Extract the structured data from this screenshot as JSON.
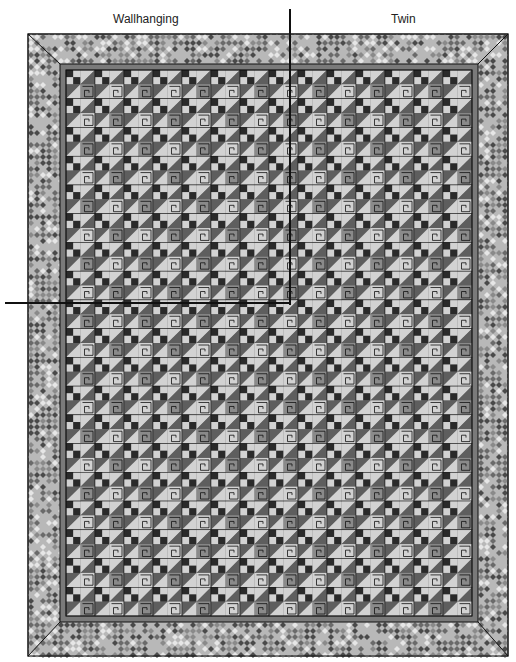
{
  "labels": {
    "left": "Wallhanging",
    "right": "Twin"
  },
  "quilt": {
    "blocks_across": 14,
    "blocks_down": 19,
    "size_markers": [
      "Wallhanging",
      "Twin"
    ],
    "colors": {
      "dark": "#2a2a2a",
      "medium_dark": "#5e5e5e",
      "medium": "#8a8a8a",
      "light": "#d2d2d2",
      "inner_border": "#7a7a7a",
      "outline": "#111111",
      "print_a": "#6a6a6a",
      "print_b": "#b8b8b8",
      "print_c": "#e6e6e6",
      "print_d": "#4a4a4a"
    }
  }
}
